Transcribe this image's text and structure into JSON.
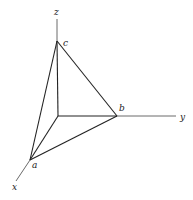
{
  "diagram": {
    "type": "3d-axes-tetrahedron",
    "axes": {
      "x": {
        "label": "x",
        "from": [
          30,
          160
        ],
        "to": [
          16,
          181
        ],
        "label_pos": [
          12,
          190
        ]
      },
      "y": {
        "label": "y",
        "from": [
          117,
          116
        ],
        "to": [
          176,
          116
        ],
        "label_pos": [
          180,
          120
        ]
      },
      "z": {
        "label": "z",
        "from": [
          57,
          41
        ],
        "to": [
          57,
          19
        ],
        "label_pos": [
          54,
          15
        ]
      }
    },
    "origin": [
      58,
      116
    ],
    "points": {
      "a": {
        "label": "a",
        "pos": [
          30,
          160
        ],
        "label_pos": [
          32,
          168
        ]
      },
      "b": {
        "label": "b",
        "pos": [
          117,
          116
        ],
        "label_pos": [
          119,
          111
        ]
      },
      "c": {
        "label": "c",
        "pos": [
          57,
          41
        ],
        "label_pos": [
          63,
          46
        ]
      }
    },
    "edges": [
      [
        "origin",
        "a"
      ],
      [
        "origin",
        "b"
      ],
      [
        "origin",
        "c"
      ],
      [
        "a",
        "b"
      ],
      [
        "b",
        "c"
      ],
      [
        "c",
        "a"
      ]
    ]
  }
}
